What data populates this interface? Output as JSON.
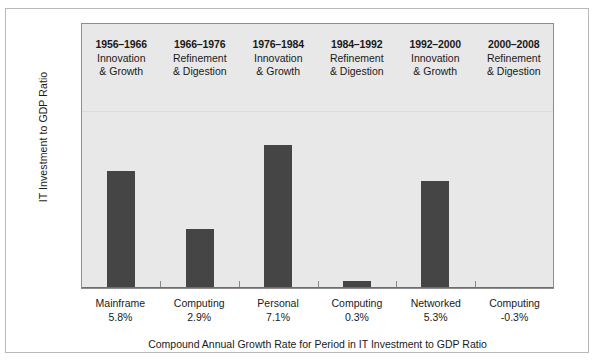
{
  "chart_data": {
    "type": "bar",
    "title": "",
    "xlabel": "Compound Annual Growth Rate for Period in IT Investment to GDP Ratio",
    "ylabel": "IT Investment to GDP Ratio",
    "grid": false,
    "legend": "none",
    "ylim": [
      -0.5,
      8.0
    ],
    "categories": [
      "Mainframe",
      "Computing",
      "Personal",
      "Computing",
      "Networked",
      "Computing"
    ],
    "value_labels": [
      "5.8%",
      "2.9%",
      "7.1%",
      "0.3%",
      "5.3%",
      "-0.3%"
    ],
    "values": [
      5.8,
      2.9,
      7.1,
      0.3,
      5.3,
      -0.3
    ],
    "period_headers": [
      {
        "years": "1956–1966",
        "line1": "Innovation",
        "line2": "& Growth"
      },
      {
        "years": "1966–1976",
        "line1": "Refinement",
        "line2": "& Digestion"
      },
      {
        "years": "1976–1984",
        "line1": "Innovation",
        "line2": "& Growth"
      },
      {
        "years": "1984–1992",
        "line1": "Refinement",
        "line2": "& Digestion"
      },
      {
        "years": "1992–2000",
        "line1": "Innovation",
        "line2": "& Growth"
      },
      {
        "years": "2000–2008",
        "line1": "Refinement",
        "line2": "& Digestion"
      }
    ],
    "colors": {
      "bar": "#454545",
      "plot_background": "#e8e8e8",
      "frame": "#b9b9b9",
      "axis": "#6e6e6e",
      "text": "#1a1a1a"
    }
  }
}
